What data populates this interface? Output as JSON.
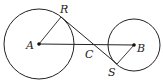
{
  "diagram": {
    "labels": {
      "A": "A",
      "B": "B",
      "C": "C",
      "R": "R",
      "S": "S"
    },
    "circles": [
      {
        "name": "circle-A",
        "cx": 39,
        "cy": 44,
        "r": 35
      },
      {
        "name": "circle-B",
        "cx": 134,
        "cy": 45,
        "r": 26
      }
    ],
    "points": {
      "A": [
        39,
        44
      ],
      "B": [
        134,
        45
      ],
      "R": [
        61,
        17
      ],
      "S": [
        117,
        64
      ],
      "C": [
        92,
        44
      ]
    },
    "colors": {
      "stroke": "#222222",
      "background": "#ffffff"
    }
  }
}
